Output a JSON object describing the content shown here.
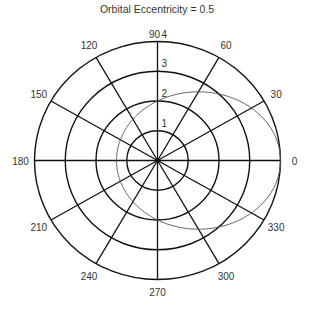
{
  "chart_data": {
    "type": "polar-line",
    "title": "Orbital Eccentricity = 0.5",
    "eccentricity": 0.5,
    "radial_ticks": [
      1,
      2,
      3,
      4
    ],
    "rmax": 4,
    "angle_ticks": [
      0,
      30,
      60,
      90,
      120,
      150,
      180,
      210,
      240,
      270,
      300,
      330
    ],
    "series": [
      {
        "name": "orbit",
        "equation": "r = 2 / (1 - 0.5*cos(theta))",
        "semi_latus_rectum": 2,
        "r_at_0": 4,
        "r_at_90": 2,
        "r_at_180": 1.333,
        "r_at_270": 2,
        "color": "#555555"
      }
    ],
    "grid": true,
    "legend": "none"
  },
  "colors": {
    "grid": "#111111",
    "orbit": "#555555",
    "text": "#333333"
  }
}
